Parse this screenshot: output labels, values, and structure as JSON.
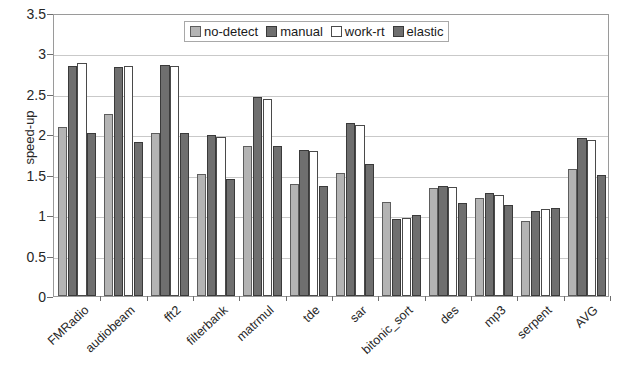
{
  "chart_data": {
    "type": "bar",
    "title": "",
    "subtitle": "",
    "xlabel": "",
    "ylabel": "speed-up",
    "ylim": [
      0,
      3.5
    ],
    "yticks": [
      "0",
      "0.5",
      "1",
      "1.5",
      "2",
      "2.5",
      "3",
      "3.5"
    ],
    "ytick_values": [
      0,
      0.5,
      1,
      1.5,
      2,
      2.5,
      3,
      3.5
    ],
    "grid": true,
    "grid_axis": "y",
    "legend_position": "top-center-inside",
    "categories": [
      "FMRadio",
      "audiobeam",
      "fft2",
      "filterbank",
      "matrmul",
      "tde",
      "sar",
      "bitonic_sort",
      "des",
      "mp3",
      "serpent",
      "AVG"
    ],
    "series": [
      {
        "name": "no-detect",
        "color": "#b4b4b4",
        "values": [
          2.09,
          2.25,
          2.02,
          1.51,
          1.86,
          1.39,
          1.52,
          1.16,
          1.34,
          1.21,
          0.93,
          1.57
        ]
      },
      {
        "name": "manual",
        "color": "#6f6f6f",
        "values": [
          2.85,
          2.83,
          2.86,
          1.99,
          2.46,
          1.8,
          2.14,
          0.95,
          1.36,
          1.28,
          1.05,
          1.95
        ]
      },
      {
        "name": "work-rt",
        "color": "#ffffff",
        "values": [
          2.88,
          2.84,
          2.85,
          1.97,
          2.44,
          1.79,
          2.12,
          0.97,
          1.35,
          1.25,
          1.08,
          1.93
        ]
      },
      {
        "name": "elastic",
        "color": "#6f6f6f",
        "values": [
          2.02,
          1.91,
          2.02,
          1.45,
          1.86,
          1.36,
          1.63,
          1.0,
          1.15,
          1.12,
          1.09,
          1.5
        ]
      }
    ]
  }
}
